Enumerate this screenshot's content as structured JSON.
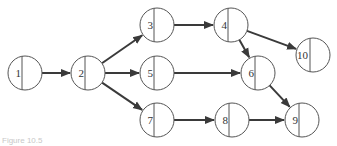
{
  "diagram": {
    "type": "network-activity-diagram",
    "node_radius": 17,
    "colors": {
      "stroke": "#555555",
      "edge": "#3a3a3a",
      "text": "#333333"
    },
    "nodes": [
      {
        "id": "1",
        "label": "1",
        "x": 25,
        "y": 73
      },
      {
        "id": "2",
        "label": "2",
        "x": 88,
        "y": 73
      },
      {
        "id": "3",
        "label": "3",
        "x": 157,
        "y": 25
      },
      {
        "id": "4",
        "label": "4",
        "x": 231,
        "y": 25
      },
      {
        "id": "5",
        "label": "5",
        "x": 157,
        "y": 73
      },
      {
        "id": "6",
        "label": "6",
        "x": 258,
        "y": 73
      },
      {
        "id": "7",
        "label": "7",
        "x": 157,
        "y": 120
      },
      {
        "id": "8",
        "label": "8",
        "x": 232,
        "y": 120
      },
      {
        "id": "9",
        "label": "9",
        "x": 302,
        "y": 120
      },
      {
        "id": "10",
        "label": "10",
        "x": 313,
        "y": 55
      }
    ],
    "edges": [
      {
        "from": "1",
        "to": "2"
      },
      {
        "from": "2",
        "to": "3"
      },
      {
        "from": "2",
        "to": "5"
      },
      {
        "from": "2",
        "to": "7"
      },
      {
        "from": "3",
        "to": "4"
      },
      {
        "from": "4",
        "to": "10"
      },
      {
        "from": "4",
        "to": "6"
      },
      {
        "from": "5",
        "to": "6"
      },
      {
        "from": "6",
        "to": "9"
      },
      {
        "from": "7",
        "to": "8"
      },
      {
        "from": "8",
        "to": "9"
      }
    ]
  },
  "caption": "Figure 10.5"
}
